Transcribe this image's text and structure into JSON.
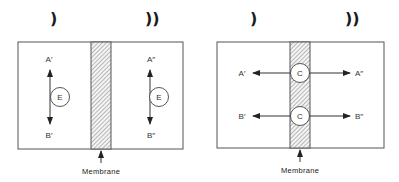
{
  "diagrams": [
    {
      "name": "enzyme-model",
      "compartment_symbols": [
        ")",
        "))"
      ],
      "labels": {
        "a_left": "A′",
        "b_left": "B′",
        "a_right": "A″",
        "b_right": "B″"
      },
      "circles": [
        "E",
        "E"
      ],
      "membrane_label": "Membrane"
    },
    {
      "name": "carrier-model",
      "compartment_symbols": [
        ")",
        "))"
      ],
      "labels": {
        "a_left": "A′",
        "b_left": "B′",
        "a_right": "A″",
        "b_right": "B″"
      },
      "circles": [
        "C",
        "C"
      ],
      "membrane_label": "Membrane"
    }
  ],
  "colors": {
    "line": "#444444",
    "hatch": "#777777",
    "background": "#ffffff"
  }
}
